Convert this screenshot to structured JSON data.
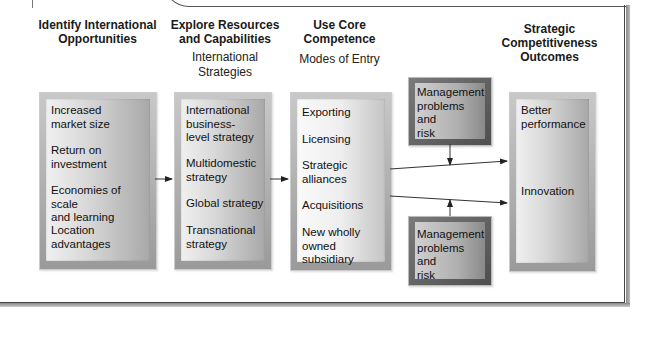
{
  "columns": [
    {
      "heading": "Identify International\nOpportunities",
      "subheading": "",
      "items": [
        "Increased\nmarket size",
        "Return on\ninvestment",
        "Economies of scale\nand learning",
        "Location\nadvantages"
      ]
    },
    {
      "heading": "Explore Resources\nand Capabilities",
      "subheading": "International\nStrategies",
      "items": [
        "International\nbusiness-\nlevel strategy",
        "Multidomestic\nstrategy",
        "Global strategy",
        "Transnational\nstrategy"
      ]
    },
    {
      "heading": "Use Core\nCompetence",
      "subheading": "Modes of Entry",
      "items": [
        "Exporting",
        "Licensing",
        "Strategic\nalliances",
        "Acquisitions",
        "New wholly\nowned subsidiary"
      ]
    },
    {
      "heading": "Strategic\nCompetitiveness\nOutcomes",
      "subheading": "",
      "items": [
        "Better\nperformance",
        "Innovation"
      ]
    }
  ],
  "moderators": [
    {
      "label": "Management\nproblems and\nrisk",
      "position": "top"
    },
    {
      "label": "Management\nproblems and\nrisk",
      "position": "bottom"
    }
  ]
}
